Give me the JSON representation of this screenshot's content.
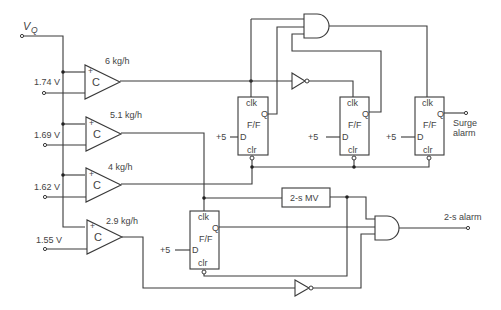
{
  "diagram": {
    "input_label": "V",
    "input_subscript": "Q",
    "comparators": [
      {
        "symbol": "C",
        "plus": "+",
        "reference": "1.74 V",
        "threshold": "6 kg/h"
      },
      {
        "symbol": "C",
        "plus": "+",
        "reference": "1.69 V",
        "threshold": "5.1 kg/h"
      },
      {
        "symbol": "C",
        "plus": "+",
        "reference": "1.62 V",
        "threshold": "4 kg/h"
      },
      {
        "symbol": "C",
        "plus": "+",
        "reference": "1.55 V",
        "threshold": "2.9 kg/h"
      }
    ],
    "flipflops": [
      {
        "clk": "clk",
        "q": "Q",
        "name": "F/F",
        "d": "D",
        "clr": "clr",
        "d_supply": "+5"
      },
      {
        "clk": "clk",
        "q": "Q",
        "name": "F/F",
        "d": "D",
        "clr": "clr",
        "d_supply": "+5"
      },
      {
        "clk": "clk",
        "q": "Q",
        "name": "F/F",
        "d": "D",
        "clr": "clr",
        "d_supply": "+5"
      },
      {
        "clk": "clk",
        "q": "Q",
        "name": "F/F",
        "d": "D",
        "clr": "clr",
        "d_supply": "+5"
      }
    ],
    "monostable": "2-s MV",
    "outputs": {
      "surge_line1": "Surge",
      "surge_line2": "alarm",
      "two_s_alarm": "2-s alarm"
    }
  }
}
